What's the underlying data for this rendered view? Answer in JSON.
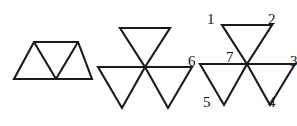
{
  "figure": {
    "type": "geometry-diagram",
    "stroke_color": "#1a1a1a",
    "background_color": "#ffffff",
    "label_color": "#141414",
    "panels": [
      {
        "id": "panel-1",
        "name": "trapezoid-three-triangles",
        "shape": "trapezoid composed of two upward triangles and one downward triangle",
        "triangle_count": 3,
        "labels": []
      },
      {
        "id": "panel-2",
        "name": "pinwheel-three-triangles",
        "shape": "three downward-pointing triangles meeting at a common center point",
        "triangle_count": 3,
        "labels": []
      },
      {
        "id": "panel-3",
        "name": "pinwheel-three-triangles-labeled",
        "shape": "three downward-pointing triangles meeting at a common center point with numbered vertices",
        "triangle_count": 3,
        "labels": [
          {
            "text": "1",
            "position": "upper-left",
            "x": 207,
            "y": 12
          },
          {
            "text": "2",
            "position": "upper-right",
            "x": 268,
            "y": 12
          },
          {
            "text": "3",
            "position": "right",
            "x": 290,
            "y": 54
          },
          {
            "text": "4",
            "position": "lower-right",
            "x": 268,
            "y": 95
          },
          {
            "text": "5",
            "position": "lower-left",
            "x": 203,
            "y": 95
          },
          {
            "text": "6",
            "position": "left",
            "x": 188,
            "y": 54
          },
          {
            "text": "7",
            "position": "center",
            "x": 226,
            "y": 50
          }
        ]
      }
    ]
  }
}
